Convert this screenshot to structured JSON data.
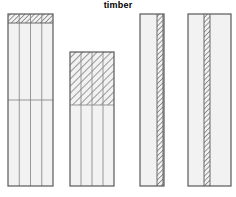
{
  "title": "timber",
  "figure": {
    "width": 236,
    "height": 197,
    "background": "#ffffff",
    "stroke_color": "#595959",
    "inner_line_color": "#8c8c8c",
    "fill_color": "#f2f2f2",
    "hatch_color": "#4d4d4d",
    "title_color": "#000000"
  },
  "specimens": [
    {
      "id": "specimen-1",
      "label": "four-strip panel with top hatched band",
      "x": 8,
      "y": 14,
      "width": 45,
      "height": 172,
      "strips": 4,
      "hatch_region": {
        "type": "top-band",
        "x": 8,
        "y": 14,
        "width": 45,
        "height": 9
      },
      "divider_lines": [
        {
          "type": "horizontal",
          "y": 100
        }
      ]
    },
    {
      "id": "specimen-2",
      "label": "four-strip panel with large top hatched block",
      "x": 70,
      "y": 52,
      "width": 44,
      "height": 134,
      "strips": 4,
      "hatch_region": {
        "type": "top-band",
        "x": 70,
        "y": 52,
        "width": 44,
        "height": 53
      },
      "divider_lines": [
        {
          "type": "horizontal",
          "y": 105
        }
      ]
    },
    {
      "id": "specimen-3",
      "label": "plain panel with right-edge hatched strip",
      "x": 140,
      "y": 14,
      "width": 24,
      "height": 172,
      "strips": 1,
      "hatch_region": {
        "type": "vertical-strip",
        "x": 157,
        "y": 14,
        "width": 6,
        "height": 172
      },
      "divider_lines": []
    },
    {
      "id": "specimen-4",
      "label": "plain panel with centered hatched strip",
      "x": 188,
      "y": 14,
      "width": 43,
      "height": 172,
      "strips": 1,
      "hatch_region": {
        "type": "vertical-strip",
        "x": 204,
        "y": 14,
        "width": 6,
        "height": 172
      },
      "divider_lines": []
    }
  ]
}
